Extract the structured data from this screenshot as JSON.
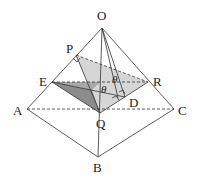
{
  "diagram": {
    "type": "3d-pyramid",
    "points": {
      "O": {
        "label": "O",
        "x": 102,
        "y": 28
      },
      "P": {
        "label": "P",
        "x": 76,
        "y": 55
      },
      "E": {
        "label": "E",
        "x": 52,
        "y": 82
      },
      "R": {
        "label": "R",
        "x": 148,
        "y": 82
      },
      "A": {
        "label": "A",
        "x": 27,
        "y": 109
      },
      "C": {
        "label": "C",
        "x": 174,
        "y": 109
      },
      "Q": {
        "label": "Q",
        "x": 100,
        "y": 113
      },
      "D": {
        "label": "D",
        "x": 125,
        "y": 97
      },
      "B": {
        "label": "B",
        "x": 98,
        "y": 157
      }
    },
    "angles": [
      {
        "label": "θ",
        "at": "upper"
      },
      {
        "label": "θ",
        "at": "lower"
      }
    ],
    "colors": {
      "light_fill": "#d4d4d4",
      "dark_fill": "#8a8a8a",
      "line": "#333333"
    }
  }
}
